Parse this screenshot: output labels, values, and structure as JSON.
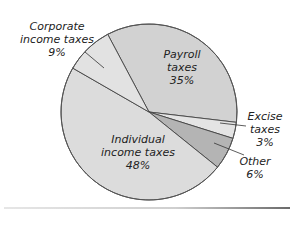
{
  "chart_data": {
    "type": "pie",
    "title": "",
    "slices": [
      {
        "label": "Payroll taxes",
        "value": 35,
        "display": "35%",
        "color": "#d2d2d2"
      },
      {
        "label": "Excise taxes",
        "value": 3,
        "display": "3%",
        "color": "#e4e4e4"
      },
      {
        "label": "Other",
        "value": 6,
        "display": "6%",
        "color": "#b4b4b4"
      },
      {
        "label": "Individual income taxes",
        "value": 48,
        "display": "48%",
        "color": "#dcdcdc"
      },
      {
        "label": "Corporate income taxes",
        "value": 9,
        "display": "9%",
        "color": "#e2e2e2"
      }
    ],
    "start_angle_deg": -28,
    "center": [
      149,
      112
    ],
    "radius": 88
  },
  "labels": {
    "corporate": {
      "line1": "Corporate",
      "line2": "income taxes",
      "line3": "9%"
    },
    "payroll": {
      "line1": "Payroll",
      "line2": "taxes",
      "line3": "35%"
    },
    "excise": {
      "line1": "Excise",
      "line2": "taxes",
      "line3": "3%"
    },
    "individual": {
      "line1": "Individual",
      "line2": "income taxes",
      "line3": "48%"
    },
    "other": {
      "line1": "Other",
      "line2": "6%"
    }
  }
}
